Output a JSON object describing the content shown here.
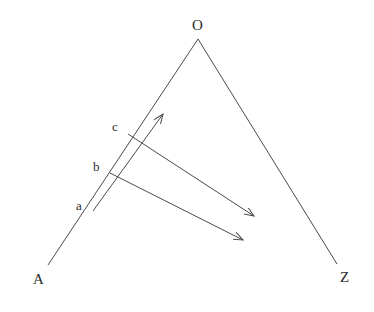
{
  "figure": {
    "title": "",
    "background_color": "#ffffff",
    "stroke_color": "#4a4a4a",
    "label_color": "#2b2b2b",
    "labels": {
      "apex": "O",
      "left_end": "A",
      "right_end": "Z",
      "point_c": "c",
      "point_b": "b",
      "point_a": "a"
    },
    "label_positions": {
      "apex": {
        "x": 192,
        "y": 18
      },
      "left_end": {
        "x": 33,
        "y": 272
      },
      "right_end": {
        "x": 340,
        "y": 270
      },
      "point_c": {
        "x": 112,
        "y": 120
      },
      "point_b": {
        "x": 93,
        "y": 160
      },
      "point_a": {
        "x": 76,
        "y": 199
      }
    },
    "geometry": {
      "apex": {
        "x": 198,
        "y": 39
      },
      "left_end": {
        "x": 48,
        "y": 265
      },
      "right_end": {
        "x": 337,
        "y": 264
      },
      "point_c": {
        "x": 128,
        "y": 134
      },
      "point_b": {
        "x": 110,
        "y": 173
      },
      "point_a": {
        "x": 93,
        "y": 211
      },
      "arrow_from_a": {
        "x": 163,
        "y": 114
      },
      "arrow_from_c": {
        "x": 254,
        "y": 216
      },
      "arrow_from_b": {
        "x": 243,
        "y": 240
      }
    }
  }
}
